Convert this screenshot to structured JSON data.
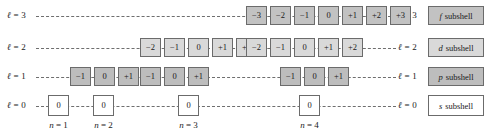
{
  "figure": {
    "colors": {
      "f_fill": "#c2c2c2",
      "d_fill": "#d9d9d9",
      "p_fill": "#bdbdbd",
      "s_fill": "#ffffff",
      "border": "#6b6b6b",
      "dash": "#6e6e6e",
      "text": "#1a1a1a",
      "background": "#ffffff"
    },
    "rows": [
      {
        "key": "f",
        "left_label": "ℓ = 3",
        "right_label": "ℓ = 3",
        "legend_symbol": "f",
        "legend_text": "subshell",
        "groups": [
          {
            "n": 4,
            "ml_values": [
              "−3",
              "−2",
              "−1",
              "0",
              "+1",
              "+2",
              "+3"
            ]
          }
        ]
      },
      {
        "key": "d",
        "left_label": "ℓ = 2",
        "right_label": "ℓ = 2",
        "legend_symbol": "d",
        "legend_text": "subshell",
        "groups": [
          {
            "n": 3,
            "ml_values": [
              "−2",
              "−1",
              "0",
              "+1",
              "+2"
            ]
          },
          {
            "n": 4,
            "ml_values": [
              "−2",
              "−1",
              "0",
              "+1",
              "+2"
            ]
          }
        ]
      },
      {
        "key": "p",
        "left_label": "ℓ = 1",
        "right_label": "ℓ = 1",
        "legend_symbol": "p",
        "legend_text": "subshell",
        "groups": [
          {
            "n": 2,
            "ml_values": [
              "−1",
              "0",
              "+1"
            ]
          },
          {
            "n": 3,
            "ml_values": [
              "−1",
              "0",
              "+1"
            ]
          },
          {
            "n": 4,
            "ml_values": [
              "−1",
              "0",
              "+1"
            ]
          }
        ]
      },
      {
        "key": "s",
        "left_label": "ℓ = 0",
        "right_label": "ℓ = 0",
        "legend_symbol": "s",
        "legend_text": "subshell",
        "groups": [
          {
            "n": 1,
            "ml_values": [
              "0"
            ]
          },
          {
            "n": 2,
            "ml_values": [
              "0"
            ]
          },
          {
            "n": 3,
            "ml_values": [
              "0"
            ]
          },
          {
            "n": 4,
            "ml_values": [
              "0"
            ]
          }
        ]
      }
    ],
    "n_labels": [
      {
        "text": "n = 1"
      },
      {
        "text": "n = 2"
      },
      {
        "text": "n = 3"
      },
      {
        "text": "n = 4"
      }
    ],
    "f_row_boxes": [
      "−3",
      "−2",
      "−1",
      "0",
      "+1",
      "+2",
      "+3"
    ],
    "d_row_boxes_n3": [
      "−2",
      "−1",
      "0",
      "+1",
      "+2"
    ],
    "d_row_boxes_n4": [
      "−2",
      "−1",
      "0",
      "+1",
      "+2"
    ],
    "p_row_boxes_n2": [
      "−1",
      "0",
      "+1"
    ],
    "p_row_boxes_n3": [
      "−1",
      "0",
      "+1"
    ],
    "p_row_boxes_n4": [
      "−1",
      "0",
      "+1"
    ],
    "s_row_boxes": [
      "0",
      "0",
      "0",
      "0"
    ],
    "legend": [
      {
        "symbol": "f",
        "text": "subshell"
      },
      {
        "symbol": "d",
        "text": "subshell"
      },
      {
        "symbol": "p",
        "text": "subshell"
      },
      {
        "symbol": "s",
        "text": "subshell"
      }
    ]
  }
}
